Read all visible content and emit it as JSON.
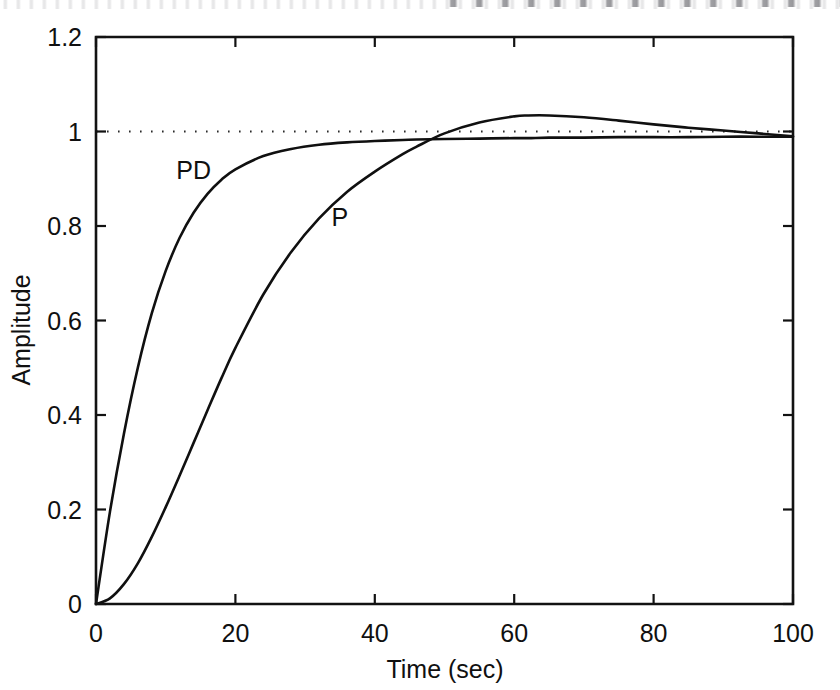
{
  "chart_data": {
    "type": "line",
    "title": "",
    "xlabel": "Time (sec)",
    "ylabel": "Amplitude",
    "xlim": [
      0,
      100
    ],
    "ylim": [
      0,
      1.2
    ],
    "xticks": [
      "0",
      "20",
      "40",
      "60",
      "80",
      "100"
    ],
    "xtick_values": [
      0,
      20,
      40,
      60,
      80,
      100
    ],
    "yticks": [
      "0",
      "0.2",
      "0.4",
      "0.6",
      "0.8",
      "1",
      "1.2"
    ],
    "ytick_values": [
      0,
      0.2,
      0.4,
      0.6,
      0.8,
      1,
      1.2
    ],
    "grid": false,
    "legend_position": "inline-annotations",
    "line_color": "#101010",
    "background_color": "#ffffff",
    "reference_line": {
      "label": "steady-state reference",
      "y": 1,
      "style": "dotted",
      "color": "#2a2a2a"
    },
    "annotations": [
      {
        "text": "PD",
        "x": 14,
        "y": 0.9
      },
      {
        "text": "P",
        "x": 35,
        "y": 0.8
      }
    ],
    "x": [
      0,
      2,
      4,
      6,
      8,
      10,
      12,
      14,
      16,
      18,
      20,
      24,
      28,
      32,
      36,
      40,
      44,
      46,
      50,
      55,
      60,
      62,
      65,
      70,
      75,
      80,
      85,
      90,
      95,
      100
    ],
    "series": [
      {
        "name": "PD",
        "values": [
          0.0,
          0.195,
          0.36,
          0.5,
          0.615,
          0.705,
          0.775,
          0.828,
          0.868,
          0.898,
          0.92,
          0.948,
          0.963,
          0.972,
          0.977,
          0.98,
          0.982,
          0.983,
          0.984,
          0.985,
          0.986,
          0.986,
          0.987,
          0.987,
          0.988,
          0.988,
          0.988,
          0.989,
          0.989,
          0.989
        ]
      },
      {
        "name": "P",
        "values": [
          0.0,
          0.012,
          0.042,
          0.086,
          0.142,
          0.205,
          0.272,
          0.341,
          0.41,
          0.478,
          0.542,
          0.655,
          0.745,
          0.816,
          0.872,
          0.915,
          0.952,
          0.968,
          0.996,
          1.019,
          1.032,
          1.034,
          1.034,
          1.03,
          1.023,
          1.015,
          1.008,
          1.002,
          0.996,
          0.99
        ]
      }
    ]
  }
}
